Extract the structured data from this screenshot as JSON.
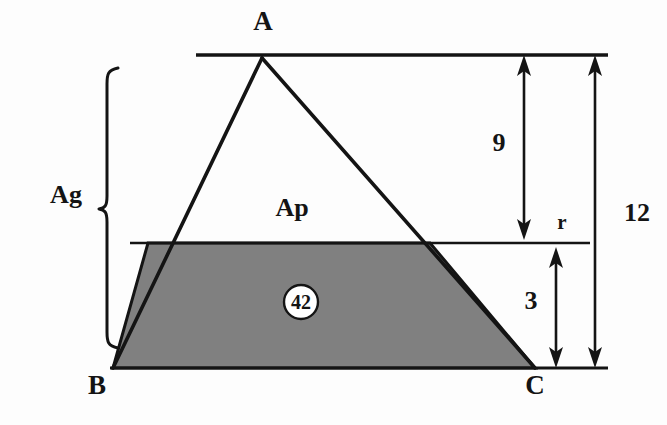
{
  "figure": {
    "type": "geometry-diagram",
    "background_color": "#fdfdfd",
    "stroke_color": "#141414",
    "shaded_fill_color": "#808080"
  },
  "vertices": [
    {
      "name": "A",
      "label": "A",
      "role": "apex"
    },
    {
      "name": "B",
      "label": "B",
      "role": "base-left"
    },
    {
      "name": "C",
      "label": "C",
      "role": "base-right"
    }
  ],
  "regions": [
    {
      "name": "upper-triangle",
      "label": "Ap",
      "shaded": false
    },
    {
      "name": "lower-trapezoid",
      "label": "42",
      "shaded": true,
      "label_style": "circled"
    }
  ],
  "dimensions": [
    {
      "name": "upper-height",
      "label": "9",
      "from": "top-line",
      "to": "parallel-line"
    },
    {
      "name": "lower-height",
      "label": "3",
      "from": "parallel-line",
      "to": "base-line"
    },
    {
      "name": "total-height",
      "label": "12",
      "from": "top-line",
      "to": "base-line"
    }
  ],
  "annotations": [
    {
      "name": "parallel-line-label",
      "label": "r"
    },
    {
      "name": "total-area-brace-label",
      "label": "Ag"
    }
  ]
}
